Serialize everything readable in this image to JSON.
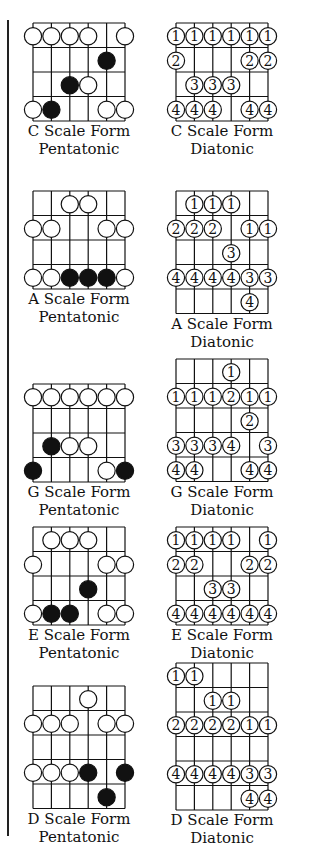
{
  "colors": {
    "ink": "#111111",
    "paper": "#ffffff"
  },
  "diagrams": [
    {
      "id": "c-pentatonic",
      "column": "left",
      "x": 20,
      "y": 22,
      "rows": 4,
      "type": "pentatonic",
      "caption": [
        "C Scale Form",
        "Pentatonic"
      ],
      "notes": [
        {
          "s": 0,
          "r": 0,
          "f": "open"
        },
        {
          "s": 1,
          "r": 0,
          "f": "open"
        },
        {
          "s": 2,
          "r": 0,
          "f": "open"
        },
        {
          "s": 3,
          "r": 0,
          "f": "open"
        },
        {
          "s": 5,
          "r": 0,
          "f": "open"
        },
        {
          "s": 4,
          "r": 1,
          "f": "filled"
        },
        {
          "s": 2,
          "r": 2,
          "f": "filled"
        },
        {
          "s": 3,
          "r": 2,
          "f": "open"
        },
        {
          "s": 0,
          "r": 3,
          "f": "open"
        },
        {
          "s": 1,
          "r": 3,
          "f": "filled"
        },
        {
          "s": 4,
          "r": 3,
          "f": "open"
        },
        {
          "s": 5,
          "r": 3,
          "f": "open"
        }
      ]
    },
    {
      "id": "c-diatonic",
      "column": "right",
      "x": 163,
      "y": 22,
      "rows": 4,
      "type": "diatonic",
      "caption": [
        "C Scale Form",
        "Diatonic"
      ],
      "notes": [
        {
          "s": 0,
          "r": 0,
          "n": "1"
        },
        {
          "s": 1,
          "r": 0,
          "n": "1"
        },
        {
          "s": 2,
          "r": 0,
          "n": "1"
        },
        {
          "s": 3,
          "r": 0,
          "n": "1"
        },
        {
          "s": 4,
          "r": 0,
          "n": "1"
        },
        {
          "s": 5,
          "r": 0,
          "n": "1"
        },
        {
          "s": 0,
          "r": 1,
          "n": "2"
        },
        {
          "s": 4,
          "r": 1,
          "n": "2"
        },
        {
          "s": 5,
          "r": 1,
          "n": "2"
        },
        {
          "s": 1,
          "r": 2,
          "n": "3"
        },
        {
          "s": 2,
          "r": 2,
          "n": "3"
        },
        {
          "s": 3,
          "r": 2,
          "n": "3"
        },
        {
          "s": 0,
          "r": 3,
          "n": "4"
        },
        {
          "s": 1,
          "r": 3,
          "n": "4"
        },
        {
          "s": 2,
          "r": 3,
          "n": "4"
        },
        {
          "s": 4,
          "r": 3,
          "n": "4"
        },
        {
          "s": 5,
          "r": 3,
          "n": "4"
        }
      ]
    },
    {
      "id": "a-pentatonic",
      "column": "left",
      "x": 20,
      "y": 190,
      "rows": 4,
      "type": "pentatonic",
      "caption": [
        "A Scale Form",
        "Pentatonic"
      ],
      "notes": [
        {
          "s": 2,
          "r": 0,
          "f": "open"
        },
        {
          "s": 3,
          "r": 0,
          "f": "open"
        },
        {
          "s": 0,
          "r": 1,
          "f": "open"
        },
        {
          "s": 1,
          "r": 1,
          "f": "open"
        },
        {
          "s": 4,
          "r": 1,
          "f": "open"
        },
        {
          "s": 5,
          "r": 1,
          "f": "open"
        },
        {
          "s": 0,
          "r": 3,
          "f": "open"
        },
        {
          "s": 1,
          "r": 3,
          "f": "open"
        },
        {
          "s": 2,
          "r": 3,
          "f": "filled"
        },
        {
          "s": 3,
          "r": 3,
          "f": "filled"
        },
        {
          "s": 4,
          "r": 3,
          "f": "filled"
        },
        {
          "s": 5,
          "r": 3,
          "f": "open"
        }
      ]
    },
    {
      "id": "a-diatonic",
      "column": "right",
      "x": 163,
      "y": 190,
      "rows": 5,
      "type": "diatonic",
      "caption": [
        "A Scale Form",
        "Diatonic"
      ],
      "notes": [
        {
          "s": 1,
          "r": 0,
          "n": "1"
        },
        {
          "s": 2,
          "r": 0,
          "n": "1"
        },
        {
          "s": 3,
          "r": 0,
          "n": "1"
        },
        {
          "s": 0,
          "r": 1,
          "n": "2"
        },
        {
          "s": 1,
          "r": 1,
          "n": "2"
        },
        {
          "s": 2,
          "r": 1,
          "n": "2"
        },
        {
          "s": 4,
          "r": 1,
          "n": "1"
        },
        {
          "s": 5,
          "r": 1,
          "n": "1"
        },
        {
          "s": 3,
          "r": 2,
          "n": "3"
        },
        {
          "s": 0,
          "r": 3,
          "n": "4"
        },
        {
          "s": 1,
          "r": 3,
          "n": "4"
        },
        {
          "s": 2,
          "r": 3,
          "n": "4"
        },
        {
          "s": 3,
          "r": 3,
          "n": "4"
        },
        {
          "s": 4,
          "r": 3,
          "n": "3"
        },
        {
          "s": 5,
          "r": 3,
          "n": "3"
        },
        {
          "s": 4,
          "r": 4,
          "n": "4"
        }
      ]
    },
    {
      "id": "g-pentatonic",
      "column": "left",
      "x": 20,
      "y": 383,
      "rows": 4,
      "type": "pentatonic",
      "caption": [
        "G Scale Form",
        "Pentatonic"
      ],
      "notes": [
        {
          "s": 0,
          "r": 0,
          "f": "open"
        },
        {
          "s": 1,
          "r": 0,
          "f": "open"
        },
        {
          "s": 2,
          "r": 0,
          "f": "open"
        },
        {
          "s": 3,
          "r": 0,
          "f": "open"
        },
        {
          "s": 4,
          "r": 0,
          "f": "open"
        },
        {
          "s": 5,
          "r": 0,
          "f": "open"
        },
        {
          "s": 1,
          "r": 2,
          "f": "filled"
        },
        {
          "s": 2,
          "r": 2,
          "f": "open"
        },
        {
          "s": 3,
          "r": 2,
          "f": "open"
        },
        {
          "s": 0,
          "r": 3,
          "f": "filled"
        },
        {
          "s": 4,
          "r": 3,
          "f": "open"
        },
        {
          "s": 5,
          "r": 3,
          "f": "filled"
        }
      ]
    },
    {
      "id": "g-diatonic",
      "column": "right",
      "x": 163,
      "y": 358,
      "rows": 5,
      "type": "diatonic",
      "caption": [
        "G Scale Form",
        "Diatonic"
      ],
      "notes": [
        {
          "s": 3,
          "r": 0,
          "n": "1"
        },
        {
          "s": 0,
          "r": 1,
          "n": "1"
        },
        {
          "s": 1,
          "r": 1,
          "n": "1"
        },
        {
          "s": 2,
          "r": 1,
          "n": "1"
        },
        {
          "s": 3,
          "r": 1,
          "n": "2"
        },
        {
          "s": 4,
          "r": 1,
          "n": "1"
        },
        {
          "s": 5,
          "r": 1,
          "n": "1"
        },
        {
          "s": 4,
          "r": 2,
          "n": "2"
        },
        {
          "s": 0,
          "r": 3,
          "n": "3"
        },
        {
          "s": 1,
          "r": 3,
          "n": "3"
        },
        {
          "s": 2,
          "r": 3,
          "n": "3"
        },
        {
          "s": 3,
          "r": 3,
          "n": "4"
        },
        {
          "s": 5,
          "r": 3,
          "n": "3"
        },
        {
          "s": 0,
          "r": 4,
          "n": "4"
        },
        {
          "s": 1,
          "r": 4,
          "n": "4"
        },
        {
          "s": 4,
          "r": 4,
          "n": "4"
        },
        {
          "s": 5,
          "r": 4,
          "n": "4"
        }
      ]
    },
    {
      "id": "e-pentatonic",
      "column": "left",
      "x": 20,
      "y": 526,
      "rows": 4,
      "type": "pentatonic",
      "caption": [
        "E Scale Form",
        "Pentatonic"
      ],
      "notes": [
        {
          "s": 1,
          "r": 0,
          "f": "open"
        },
        {
          "s": 2,
          "r": 0,
          "f": "open"
        },
        {
          "s": 3,
          "r": 0,
          "f": "open"
        },
        {
          "s": 0,
          "r": 1,
          "f": "open"
        },
        {
          "s": 4,
          "r": 1,
          "f": "open"
        },
        {
          "s": 5,
          "r": 1,
          "f": "open"
        },
        {
          "s": 3,
          "r": 2,
          "f": "filled"
        },
        {
          "s": 0,
          "r": 3,
          "f": "open"
        },
        {
          "s": 1,
          "r": 3,
          "f": "filled"
        },
        {
          "s": 2,
          "r": 3,
          "f": "filled"
        },
        {
          "s": 4,
          "r": 3,
          "f": "open"
        },
        {
          "s": 5,
          "r": 3,
          "f": "open"
        }
      ]
    },
    {
      "id": "e-diatonic",
      "column": "right",
      "x": 163,
      "y": 526,
      "rows": 4,
      "type": "diatonic",
      "caption": [
        "E Scale Form",
        "Diatonic"
      ],
      "notes": [
        {
          "s": 0,
          "r": 0,
          "n": "1"
        },
        {
          "s": 1,
          "r": 0,
          "n": "1"
        },
        {
          "s": 2,
          "r": 0,
          "n": "1"
        },
        {
          "s": 3,
          "r": 0,
          "n": "1"
        },
        {
          "s": 5,
          "r": 0,
          "n": "1"
        },
        {
          "s": 0,
          "r": 1,
          "n": "2"
        },
        {
          "s": 1,
          "r": 1,
          "n": "2"
        },
        {
          "s": 4,
          "r": 1,
          "n": "2"
        },
        {
          "s": 5,
          "r": 1,
          "n": "2"
        },
        {
          "s": 2,
          "r": 2,
          "n": "3"
        },
        {
          "s": 3,
          "r": 2,
          "n": "3"
        },
        {
          "s": 0,
          "r": 3,
          "n": "4"
        },
        {
          "s": 1,
          "r": 3,
          "n": "4"
        },
        {
          "s": 2,
          "r": 3,
          "n": "4"
        },
        {
          "s": 3,
          "r": 3,
          "n": "4"
        },
        {
          "s": 4,
          "r": 3,
          "n": "4"
        },
        {
          "s": 5,
          "r": 3,
          "n": "4"
        }
      ]
    },
    {
      "id": "d-pentatonic",
      "column": "left",
      "x": 20,
      "y": 685,
      "rows": 5,
      "type": "pentatonic",
      "caption": [
        "D Scale Form",
        "Pentatonic"
      ],
      "notes": [
        {
          "s": 3,
          "r": 0,
          "f": "open"
        },
        {
          "s": 0,
          "r": 1,
          "f": "open"
        },
        {
          "s": 1,
          "r": 1,
          "f": "open"
        },
        {
          "s": 2,
          "r": 1,
          "f": "open"
        },
        {
          "s": 4,
          "r": 1,
          "f": "open"
        },
        {
          "s": 5,
          "r": 1,
          "f": "open"
        },
        {
          "s": 0,
          "r": 3,
          "f": "open"
        },
        {
          "s": 1,
          "r": 3,
          "f": "open"
        },
        {
          "s": 2,
          "r": 3,
          "f": "open"
        },
        {
          "s": 3,
          "r": 3,
          "f": "filled"
        },
        {
          "s": 5,
          "r": 3,
          "f": "filled"
        },
        {
          "s": 4,
          "r": 4,
          "f": "filled"
        }
      ]
    },
    {
      "id": "d-diatonic",
      "column": "right",
      "x": 163,
      "y": 662,
      "rows": 6,
      "type": "diatonic",
      "caption": [
        "D Scale Form",
        "Diatonic"
      ],
      "notes": [
        {
          "s": 0,
          "r": 0,
          "n": "1"
        },
        {
          "s": 1,
          "r": 0,
          "n": "1"
        },
        {
          "s": 2,
          "r": 1,
          "n": "1"
        },
        {
          "s": 3,
          "r": 1,
          "n": "1"
        },
        {
          "s": 0,
          "r": 2,
          "n": "2"
        },
        {
          "s": 1,
          "r": 2,
          "n": "2"
        },
        {
          "s": 2,
          "r": 2,
          "n": "2"
        },
        {
          "s": 3,
          "r": 2,
          "n": "2"
        },
        {
          "s": 4,
          "r": 2,
          "n": "1"
        },
        {
          "s": 5,
          "r": 2,
          "n": "1"
        },
        {
          "s": 0,
          "r": 4,
          "n": "4"
        },
        {
          "s": 1,
          "r": 4,
          "n": "4"
        },
        {
          "s": 2,
          "r": 4,
          "n": "4"
        },
        {
          "s": 3,
          "r": 4,
          "n": "4"
        },
        {
          "s": 4,
          "r": 4,
          "n": "3"
        },
        {
          "s": 5,
          "r": 4,
          "n": "3"
        },
        {
          "s": 4,
          "r": 5,
          "n": "4"
        },
        {
          "s": 5,
          "r": 5,
          "n": "4"
        }
      ]
    }
  ]
}
